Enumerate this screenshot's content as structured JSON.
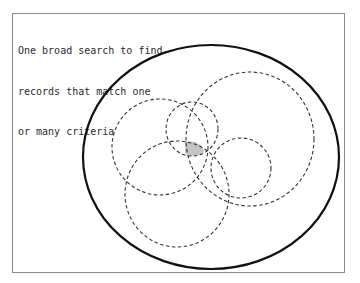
{
  "caption": {
    "lines": [
      "One broad search to find",
      "records that match one",
      "or many criteria"
    ]
  },
  "diagram": {
    "outer_set": {
      "cx": 211,
      "cy": 157,
      "rx": 128,
      "ry": 112,
      "stroke": "#111111"
    },
    "criteria_circles": [
      {
        "name": "criterion-a",
        "cx": 160,
        "cy": 147,
        "rx": 48,
        "ry": 48
      },
      {
        "name": "criterion-b",
        "cx": 192,
        "cy": 129,
        "rx": 26,
        "ry": 27
      },
      {
        "name": "criterion-c",
        "cx": 250,
        "cy": 139,
        "rx": 64,
        "ry": 67
      },
      {
        "name": "criterion-d",
        "cx": 177,
        "cy": 194,
        "rx": 52,
        "ry": 53
      },
      {
        "name": "criterion-e",
        "cx": 241,
        "cy": 168,
        "rx": 30,
        "ry": 30
      }
    ],
    "dash_color": "#333333",
    "intersection_fill": "#c4c4c4"
  }
}
